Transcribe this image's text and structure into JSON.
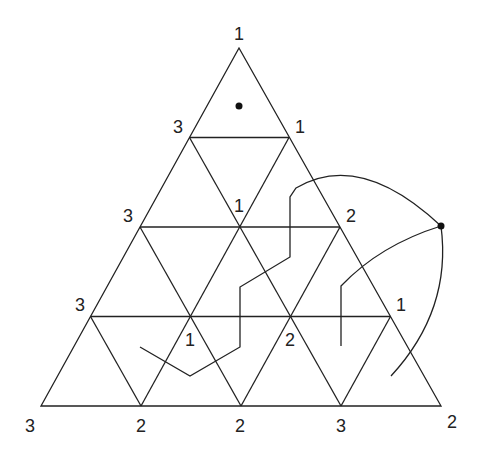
{
  "diagram": {
    "title": "",
    "colors": {
      "stroke": "#222222",
      "background": "#ffffff"
    },
    "outer_triangle": {
      "apex": [
        239,
        48
      ],
      "bottom_left": [
        41,
        406
      ],
      "bottom_right": [
        441,
        406
      ]
    },
    "subdivisions": 4,
    "vertex_labels": [
      {
        "id": "apex",
        "text": "1",
        "x": 239,
        "y": 40
      },
      {
        "id": "r1-left",
        "text": "3",
        "x": 178,
        "y": 133
      },
      {
        "id": "r1-right",
        "text": "1",
        "x": 300,
        "y": 133
      },
      {
        "id": "r2-left",
        "text": "3",
        "x": 128,
        "y": 222
      },
      {
        "id": "r2-center",
        "text": "1",
        "x": 239,
        "y": 212
      },
      {
        "id": "r2-right",
        "text": "2",
        "x": 351,
        "y": 222
      },
      {
        "id": "r3-left",
        "text": "3",
        "x": 80,
        "y": 311
      },
      {
        "id": "r3-center-left",
        "text": "1",
        "x": 190,
        "y": 346
      },
      {
        "id": "r3-center-right",
        "text": "2",
        "x": 290,
        "y": 346
      },
      {
        "id": "r3-right",
        "text": "1",
        "x": 401,
        "y": 311
      },
      {
        "id": "base-0",
        "text": "3",
        "x": 30,
        "y": 432
      },
      {
        "id": "base-1",
        "text": "2",
        "x": 141,
        "y": 432
      },
      {
        "id": "base-2",
        "text": "2",
        "x": 240,
        "y": 432
      },
      {
        "id": "base-3",
        "text": "3",
        "x": 341,
        "y": 432
      },
      {
        "id": "base-4",
        "text": "2",
        "x": 452,
        "y": 428
      }
    ],
    "dots": [
      {
        "id": "top-cell-dot",
        "x": 239,
        "y": 106
      },
      {
        "id": "outside-dot",
        "x": 441,
        "y": 226
      }
    ],
    "paths": [
      {
        "id": "left-path",
        "d": "M140,347 L190,376 L240,347 L240,287 L290,257 L290,197 L296,188 Q360,150 441,226"
      },
      {
        "id": "right-inner-path",
        "d": "M341,346 L341,286 Q380,245 441,226"
      },
      {
        "id": "right-outer-arc",
        "d": "M441,226 Q452,310 391,376"
      }
    ]
  }
}
